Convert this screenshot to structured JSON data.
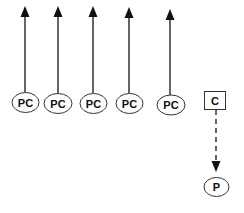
{
  "diagram": {
    "colors": {
      "stroke": "#111111",
      "background": "#ffffff"
    },
    "pc_nodes": [
      {
        "label": "PC",
        "cx": 25,
        "cy": 102,
        "arrow_x": 25
      },
      {
        "label": "PC",
        "cx": 58,
        "cy": 103,
        "arrow_x": 58
      },
      {
        "label": "PC",
        "cx": 93,
        "cy": 103,
        "arrow_x": 93
      },
      {
        "label": "PC",
        "cx": 129,
        "cy": 103,
        "arrow_x": 129
      },
      {
        "label": "PC",
        "cx": 171,
        "cy": 105,
        "arrow_x": 170
      }
    ],
    "c_node": {
      "label": "C"
    },
    "p_node": {
      "label": "P"
    },
    "edges": [
      {
        "from": "PC",
        "to": "up",
        "style": "solid"
      },
      {
        "from": "C",
        "to": "P",
        "style": "dashed"
      }
    ]
  }
}
